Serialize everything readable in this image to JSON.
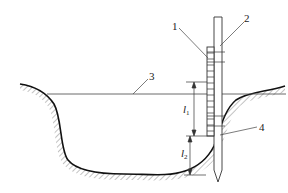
{
  "diagram": {
    "type": "water-depth-measurement-schematic",
    "labels": {
      "ruler": "1",
      "rod": "2",
      "water_surface": "3",
      "ground": "4"
    },
    "dimensions": {
      "l1": {
        "symbol": "l",
        "subscript": "1"
      },
      "l2": {
        "symbol": "l",
        "subscript": "2"
      }
    },
    "colors": {
      "line": "#222222",
      "thin_line": "#555555",
      "background": "#ffffff"
    }
  }
}
